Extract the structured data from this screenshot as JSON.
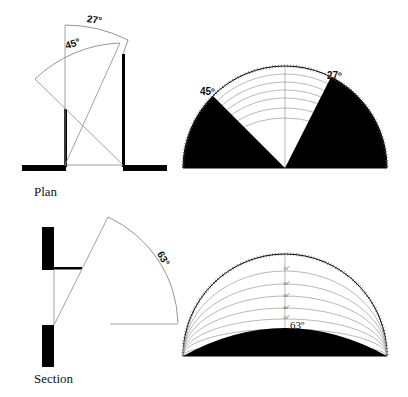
{
  "plan": {
    "label": "Plan",
    "angle_left": "45°",
    "angle_right": "27°",
    "chart_left_label": "45º",
    "chart_right_label": "27º"
  },
  "section": {
    "label": "Section",
    "angle": "63°",
    "chart_label": "63º",
    "altitude_ticks": [
      "10º",
      "20º",
      "30º",
      "40º",
      "50º"
    ]
  },
  "colors": {
    "ink": "#000000",
    "guide": "#8a8a8a",
    "background": "#ffffff"
  }
}
